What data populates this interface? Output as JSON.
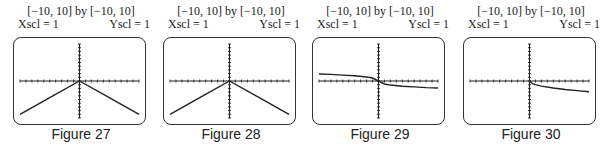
{
  "chart_data": [
    {
      "type": "line",
      "title": "[−10, 10] by [−10, 10]",
      "xscl_label": "Xscl = 1",
      "yscl_label": "Yscl = 1",
      "caption": "Figure 27",
      "xlim": [
        -10,
        10
      ],
      "ylim": [
        -10,
        10
      ],
      "x": [
        -10,
        -5,
        0,
        5,
        10
      ],
      "series": [
        {
          "name": "graph",
          "values": [
            -9,
            -4.5,
            0,
            -4.5,
            -9
          ]
        }
      ]
    },
    {
      "type": "line",
      "title": "[−10, 10] by [−10, 10]",
      "xscl_label": "Xscl = 1",
      "yscl_label": "Yscl = 1",
      "caption": "Figure 28",
      "xlim": [
        -10,
        10
      ],
      "ylim": [
        -10,
        10
      ],
      "x": [
        -10,
        -5,
        0,
        5,
        10
      ],
      "series": [
        {
          "name": "graph",
          "values": [
            -9,
            -4.5,
            0,
            -4.5,
            -9
          ]
        }
      ]
    },
    {
      "type": "line",
      "title": "[−10, 10] by [−10, 10]",
      "xscl_label": "Xscl = 1",
      "yscl_label": "Yscl = 1",
      "caption": "Figure 29",
      "xlim": [
        -10,
        10
      ],
      "ylim": [
        -10,
        10
      ],
      "x": [
        -10,
        -8,
        -6,
        -4,
        -2,
        -1,
        0,
        1,
        2,
        4,
        6,
        8,
        10
      ],
      "series": [
        {
          "name": "graph",
          "values": [
            1.9,
            1.8,
            1.6,
            1.4,
            1.1,
            0.8,
            0,
            -0.8,
            -1.1,
            -1.4,
            -1.6,
            -1.8,
            -1.9
          ]
        }
      ]
    },
    {
      "type": "line",
      "title": "[−10, 10] by [−10, 10]",
      "xscl_label": "Xscl = 1",
      "yscl_label": "Yscl = 1",
      "caption": "Figure 30",
      "xlim": [
        -10,
        10
      ],
      "ylim": [
        -10,
        10
      ],
      "x": [
        0,
        0.5,
        1,
        2,
        4,
        6,
        8,
        10
      ],
      "series": [
        {
          "name": "graph",
          "values": [
            0,
            -0.7,
            -1.0,
            -1.4,
            -1.9,
            -2.3,
            -2.6,
            -2.9
          ]
        }
      ]
    }
  ],
  "panels": [
    {
      "left": 6
    },
    {
      "left": 156
    },
    {
      "left": 305
    },
    {
      "left": 456
    }
  ]
}
